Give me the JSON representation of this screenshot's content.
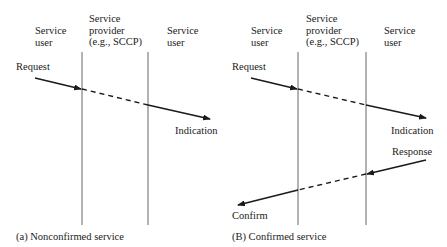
{
  "diagrams": [
    {
      "id": "a",
      "caption": "(a) Nonconfirmed service",
      "columns": {
        "left": "Service\nuser",
        "middle": "Service\nprovider\n(e.g., SCCP)",
        "right": "Service\nuser"
      },
      "primitives": {
        "request": "Request",
        "indication": "Indication"
      }
    },
    {
      "id": "b",
      "caption": "(B) Confirmed service",
      "columns": {
        "left": "Service\nuser",
        "middle": "Service\nprovider\n(e.g., SCCP)",
        "right": "Service\nuser"
      },
      "primitives": {
        "request": "Request",
        "indication": "Indication",
        "response": "Response",
        "confirm": "Confirm"
      }
    }
  ],
  "colors": {
    "ink": "#1a1a1a",
    "line": "#555555"
  }
}
